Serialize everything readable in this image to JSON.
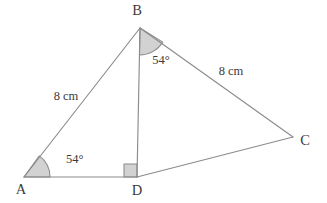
{
  "figure": {
    "background_color": "#ffffff",
    "stroke_color": "#8c8c8c",
    "fill_color": "#d2d2d2",
    "text_color": "#3b3b3b"
  },
  "vertices": [
    {
      "name": "A",
      "label": "A",
      "x": 24,
      "y": 177,
      "label_x": 21,
      "label_y": 191
    },
    {
      "name": "B",
      "label": "B",
      "x": 140,
      "y": 28,
      "label_x": 137,
      "label_y": 12
    },
    {
      "name": "C",
      "label": "C",
      "x": 293,
      "y": 137,
      "label_x": 305,
      "label_y": 142
    },
    {
      "name": "D",
      "label": "D",
      "x": 137,
      "y": 177,
      "label_x": 137,
      "label_y": 192
    }
  ],
  "edges": [
    {
      "name": "segment-ab",
      "from": "A",
      "to": "B"
    },
    {
      "name": "segment-ad",
      "from": "A",
      "to": "D"
    },
    {
      "name": "segment-dc",
      "from": "D",
      "to": "C"
    },
    {
      "name": "segment-bd",
      "from": "B",
      "to": "D"
    },
    {
      "name": "segment-bc",
      "from": "B",
      "to": "C"
    }
  ],
  "angles": [
    {
      "name": "angle-a",
      "vertex": "A",
      "value": "54°",
      "label_x": 66,
      "label_y": 160,
      "radius": 26
    },
    {
      "name": "angle-b",
      "vertex": "B",
      "value": "54°",
      "label_x": 161,
      "label_y": 61,
      "radius": 27
    },
    {
      "name": "angle-d",
      "vertex": "D",
      "value": "90°",
      "type": "right-angle",
      "size": 13
    }
  ],
  "measurements": [
    {
      "name": "length-ab",
      "edge": "segment-ab",
      "value": "8 cm",
      "label_x": 66,
      "label_y": 97
    },
    {
      "name": "length-bc",
      "edge": "segment-bc",
      "value": "8 cm",
      "label_x": 231,
      "label_y": 72
    }
  ]
}
